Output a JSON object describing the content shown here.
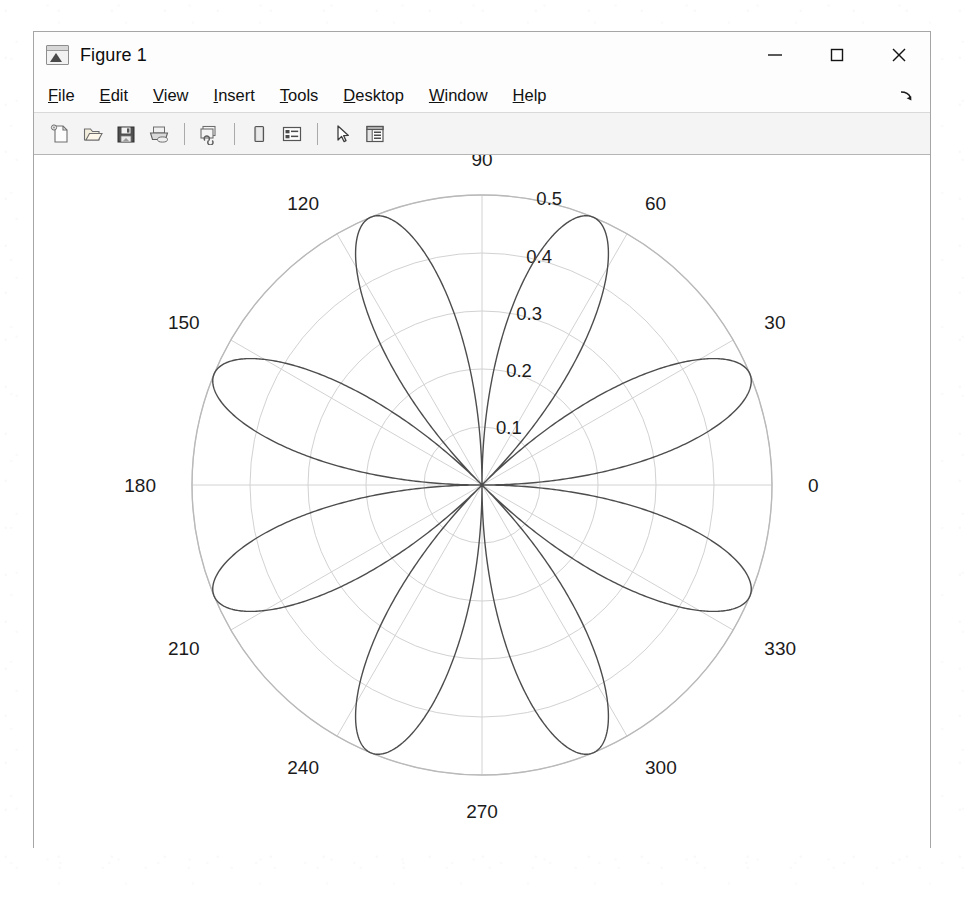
{
  "window": {
    "title": "Figure 1",
    "icon": "matlab-membrane-icon",
    "controls": {
      "minimize": "–",
      "maximize": "□",
      "close": "×"
    }
  },
  "menu": {
    "items": [
      {
        "label": "File",
        "mnemonic": "F",
        "rest": "ile"
      },
      {
        "label": "Edit",
        "mnemonic": "E",
        "rest": "dit"
      },
      {
        "label": "View",
        "mnemonic": "V",
        "rest": "iew"
      },
      {
        "label": "Insert",
        "mnemonic": "I",
        "rest": "nsert"
      },
      {
        "label": "Tools",
        "mnemonic": "T",
        "rest": "ools"
      },
      {
        "label": "Desktop",
        "mnemonic": "D",
        "rest": "esktop"
      },
      {
        "label": "Window",
        "mnemonic": "W",
        "rest": "indow"
      },
      {
        "label": "Help",
        "mnemonic": "H",
        "rest": "elp"
      }
    ],
    "dock_control": "undock-figure-arrow-icon"
  },
  "toolbar": {
    "buttons": [
      {
        "name": "new-figure-icon",
        "label": "New Figure"
      },
      {
        "name": "open-file-icon",
        "label": "Open File"
      },
      {
        "name": "save-figure-icon",
        "label": "Save Figure"
      },
      {
        "name": "print-figure-icon",
        "label": "Print Figure"
      },
      {
        "name": "separator",
        "label": ""
      },
      {
        "name": "link-plot-icon",
        "label": "Link Plot"
      },
      {
        "name": "separator",
        "label": ""
      },
      {
        "name": "colorbar-icon",
        "label": "Insert Colorbar"
      },
      {
        "name": "legend-icon",
        "label": "Insert Legend"
      },
      {
        "name": "separator",
        "label": ""
      },
      {
        "name": "data-cursor-icon",
        "label": "Data Cursor"
      },
      {
        "name": "plot-browser-icon",
        "label": "Show Plot Tools"
      }
    ]
  },
  "chart_data": {
    "type": "line",
    "plot_kind": "polar",
    "title": "",
    "xlabel": "",
    "ylabel": "",
    "theta_unit": "degrees",
    "theta_tick_labels": [
      "0",
      "30",
      "60",
      "90",
      "120",
      "150",
      "180",
      "210",
      "240",
      "270",
      "300",
      "330"
    ],
    "theta_ticks": [
      0,
      30,
      60,
      90,
      120,
      150,
      180,
      210,
      240,
      270,
      300,
      330
    ],
    "r_tick_labels": [
      "0.1",
      "0.2",
      "0.3",
      "0.4",
      "0.5"
    ],
    "r_ticks": [
      0.1,
      0.2,
      0.3,
      0.4,
      0.5
    ],
    "rlim": [
      0,
      0.5
    ],
    "grid": true,
    "legend": null,
    "series": [
      {
        "name": "rose",
        "equation": "r = 0.5*|sin(4*theta)|",
        "petal_count": 8,
        "petal_peak_radius": 0.5,
        "petal_peak_angles_deg": [
          22.5,
          67.5,
          112.5,
          157.5,
          202.5,
          247.5,
          292.5,
          337.5
        ],
        "zero_angles_deg": [
          0,
          45,
          90,
          135,
          180,
          225,
          270,
          315
        ],
        "color": "#4d4d4d",
        "line_width": 1.4
      }
    ]
  },
  "colors": {
    "grid": "#d2d2d2",
    "outer_circle": "#b9b9b9",
    "curve": "#4d4d4d",
    "tick_text": "#1b1b1b",
    "figure_background": "#ffffff",
    "window_chrome": "#fdfdfd",
    "toolbar_background": "#f4f4f4"
  }
}
